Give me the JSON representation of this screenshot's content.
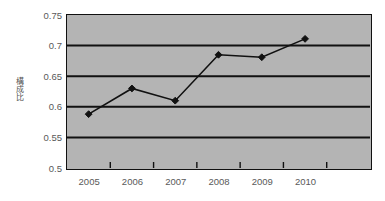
{
  "chart_data": {
    "type": "line",
    "title": "",
    "xlabel": "",
    "ylabel": "構成比",
    "categories": [
      "2005",
      "2006",
      "2007",
      "2008",
      "2009",
      "2010"
    ],
    "values": [
      0.588,
      0.63,
      0.61,
      0.685,
      0.681,
      0.711
    ],
    "series": [
      {
        "name": "構成比",
        "values": [
          0.588,
          0.63,
          0.61,
          0.685,
          0.681,
          0.711
        ]
      }
    ],
    "ylim": [
      0.5,
      0.75
    ],
    "ytick_labels": [
      "0.75",
      "0.7",
      "0.65",
      "0.6",
      "0.55",
      "0.5"
    ],
    "ytick_values": [
      0.75,
      0.7,
      0.65,
      0.6,
      0.55,
      0.5
    ],
    "grid": true,
    "legend": "none",
    "marker": "diamond",
    "colors": {
      "plot_background": "#b4b4b4",
      "line": "#111111",
      "marker": "#111111",
      "gridline": "#111111",
      "axis": "#111111",
      "tick_text": "#595959",
      "page_background": "#ffffff"
    }
  }
}
